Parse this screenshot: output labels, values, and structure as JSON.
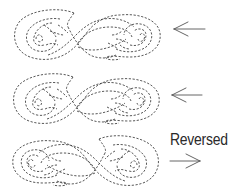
{
  "figure": {
    "type": "quilting stitch pattern illustration",
    "stitch_style": "dashed",
    "stitch_color": "#3a3a3a",
    "arrow_color": "#555555"
  },
  "patterns": [
    {
      "id": "pattern-1",
      "orientation": "original",
      "arrow": {
        "direction": "left",
        "icon": "arrow-left-icon"
      }
    },
    {
      "id": "pattern-2",
      "orientation": "original",
      "arrow": {
        "direction": "left",
        "icon": "arrow-left-icon"
      }
    },
    {
      "id": "pattern-3",
      "orientation": "mirrored",
      "label": "Reversed",
      "arrow": {
        "direction": "right",
        "icon": "arrow-right-icon"
      }
    }
  ]
}
